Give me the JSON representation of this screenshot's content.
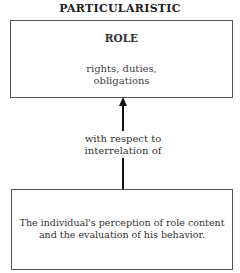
{
  "diagram": {
    "title": "PARTICULARISTIC",
    "top_box": {
      "label": "ROLE",
      "content_lines": [
        "rights, duties,",
        "obligations"
      ]
    },
    "connector": {
      "direction": "up",
      "label_lines": [
        "with respect to",
        "interrelation of"
      ]
    },
    "bottom_box": {
      "content_lines": [
        "The individual's perception of role content",
        "and the evaluation of his behavior."
      ]
    }
  }
}
